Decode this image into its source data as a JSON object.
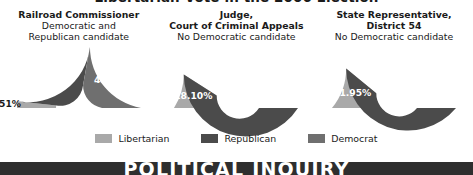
{
  "title": "Libertarian Vote in the 2006 Election",
  "banner": {
    "text": "POLITICAL INQUIRY",
    "bg_color": "#2e2e2e",
    "text_color": "#ffffff"
  },
  "colors": {
    "libertarian": "#a9a9a9",
    "republican": "#4b4b4b",
    "democrat": "#6f6f6f",
    "hole": "#ffffff",
    "label_dark": "#1a1a1a",
    "label_light": "#ffffff"
  },
  "legend": {
    "items": [
      {
        "label": "Libertarian",
        "color": "#a9a9a9"
      },
      {
        "label": "Republican",
        "color": "#4b4b4b"
      },
      {
        "label": "Democrat",
        "color": "#6f6f6f"
      }
    ]
  },
  "panels": [
    {
      "heading_lines": [
        {
          "text": "Railroad Commissioner",
          "bold": true
        },
        {
          "text": "Democratic and",
          "bold": false
        },
        {
          "text": "Republican candidate",
          "bold": false
        }
      ],
      "segments": [
        {
          "party": "Libertarian",
          "value": 3.51,
          "label": "3.51%",
          "color": "#a9a9a9",
          "label_position": "outside"
        },
        {
          "party": "Republican",
          "value": 52.13,
          "label": "52.13%",
          "color": "#4b4b4b",
          "label_position": "inside"
        },
        {
          "party": "Democrat",
          "value": 44.35,
          "label": "44.35%",
          "color": "#6f6f6f",
          "label_position": "inside"
        }
      ]
    },
    {
      "heading_lines": [
        {
          "text": "Judge,",
          "bold": true
        },
        {
          "text": "Court of Criminal Appeals",
          "bold": true
        },
        {
          "text": "No Democratic candidate",
          "bold": false
        }
      ],
      "segments": [
        {
          "party": "Libertarian",
          "value": 18.1,
          "label": "18.10%",
          "color": "#a9a9a9",
          "label_position": "inside"
        },
        {
          "party": "Republican",
          "value": 81.89,
          "label": "81.89%",
          "color": "#4b4b4b",
          "label_position": "inside"
        }
      ]
    },
    {
      "heading_lines": [
        {
          "text": "State Representative,",
          "bold": true
        },
        {
          "text": "District 54",
          "bold": true
        },
        {
          "text": "No Democratic candidate",
          "bold": false
        }
      ],
      "segments": [
        {
          "party": "Libertarian",
          "value": 21.95,
          "label": "21.95%",
          "color": "#a9a9a9",
          "label_position": "inside"
        },
        {
          "party": "Republican",
          "value": 78.04,
          "label": "78.04%",
          "color": "#4b4b4b",
          "label_position": "inside"
        }
      ]
    }
  ],
  "chart_data": {
    "type": "pie",
    "title": "Libertarian Vote in the 2006 Election",
    "variant": "semicircular-donut",
    "units": "percent",
    "legend_position": "bottom",
    "charts": [
      {
        "title": "Railroad Commissioner",
        "subtitle": "Democratic and Republican candidate",
        "categories": [
          "Libertarian",
          "Republican",
          "Democrat"
        ],
        "values": [
          3.51,
          52.13,
          44.35
        ]
      },
      {
        "title": "Judge, Court of Criminal Appeals",
        "subtitle": "No Democratic candidate",
        "categories": [
          "Libertarian",
          "Republican"
        ],
        "values": [
          18.1,
          81.89
        ]
      },
      {
        "title": "State Representative, District 54",
        "subtitle": "No Democratic candidate",
        "categories": [
          "Libertarian",
          "Republican"
        ],
        "values": [
          21.95,
          78.04
        ]
      }
    ]
  }
}
